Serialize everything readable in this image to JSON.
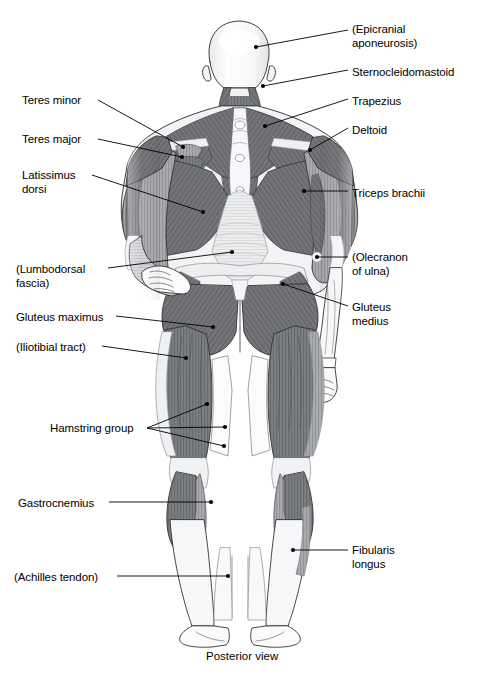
{
  "figure": {
    "caption": "Posterior view",
    "caption_pos": {
      "x": 206,
      "y": 650
    },
    "width": 479,
    "height": 677,
    "background": "#ffffff",
    "line_color": "#000000",
    "muscle_dark": "#6f7073",
    "muscle_mid": "#8e9094",
    "muscle_light": "#c8cacd",
    "tendon_light": "#f1f2f3",
    "skin": "#fdfdfd"
  },
  "labels": [
    {
      "id": "epicranial-aponeurosis",
      "text": "(Epicranial\naponeurosis)",
      "side": "right",
      "lines": [
        "(Epicranial",
        "aponeurosis)"
      ],
      "x": 352,
      "y": 22,
      "leader": [
        [
          348,
          30
        ],
        [
          256,
          47
        ]
      ],
      "dot": [
        256,
        47
      ]
    },
    {
      "id": "sternocleidomastoid",
      "text": "Sternocleidomastoid",
      "side": "right",
      "lines": [
        "Sternocleidomastoid"
      ],
      "x": 352,
      "y": 65,
      "leader": [
        [
          348,
          70
        ],
        [
          263,
          86
        ]
      ],
      "dot": [
        263,
        86
      ]
    },
    {
      "id": "trapezius",
      "text": "Trapezius",
      "side": "right",
      "lines": [
        "Trapezius"
      ],
      "x": 352,
      "y": 94,
      "leader": [
        [
          348,
          99
        ],
        [
          265,
          126
        ]
      ],
      "dot": [
        265,
        126
      ]
    },
    {
      "id": "deltoid",
      "text": "Deltoid",
      "side": "right",
      "lines": [
        "Deltoid"
      ],
      "x": 352,
      "y": 123,
      "leader": [
        [
          348,
          128
        ],
        [
          310,
          150
        ]
      ],
      "dot": [
        310,
        150
      ]
    },
    {
      "id": "triceps-brachii",
      "text": "Triceps brachii",
      "side": "right",
      "lines": [
        "Triceps brachii"
      ],
      "x": 352,
      "y": 186,
      "leader": [
        [
          348,
          191
        ],
        [
          304,
          191
        ]
      ],
      "dot": [
        304,
        191
      ]
    },
    {
      "id": "olecranon-of-ulna",
      "text": "(Olecranon\nof ulna)",
      "side": "right",
      "lines": [
        "(Olecranon",
        "of ulna)"
      ],
      "x": 352,
      "y": 250,
      "leader": [
        [
          348,
          257
        ],
        [
          317,
          257
        ]
      ],
      "dot": [
        317,
        257
      ]
    },
    {
      "id": "gluteus-medius",
      "text": "Gluteus\nmedius",
      "side": "right",
      "lines": [
        "Gluteus",
        "medius"
      ],
      "x": 352,
      "y": 300,
      "leader": [
        [
          348,
          306
        ],
        [
          283,
          284
        ]
      ],
      "dot": [
        283,
        284
      ]
    },
    {
      "id": "fibularis-longus",
      "text": "Fibularis\nlongus",
      "side": "right",
      "lines": [
        "Fibularis",
        "longus"
      ],
      "x": 352,
      "y": 543,
      "leader": [
        [
          348,
          550
        ],
        [
          293,
          550
        ]
      ],
      "dot": [
        293,
        550
      ]
    },
    {
      "id": "teres-minor",
      "text": "Teres minor",
      "side": "left",
      "lines": [
        "Teres minor"
      ],
      "x": 22,
      "y": 93,
      "leader": [
        [
          98,
          100
        ],
        [
          183,
          147
        ]
      ],
      "dot": [
        183,
        147
      ]
    },
    {
      "id": "teres-major",
      "text": "Teres major",
      "side": "left",
      "lines": [
        "Teres major"
      ],
      "x": 22,
      "y": 132,
      "leader": [
        [
          98,
          139
        ],
        [
          182,
          157
        ]
      ],
      "dot": [
        182,
        157
      ]
    },
    {
      "id": "latissimus-dorsi",
      "text": "Latissimus\ndorsi",
      "side": "left",
      "lines": [
        "Latissimus",
        "dorsi"
      ],
      "x": 22,
      "y": 168,
      "leader": [
        [
          92,
          175
        ],
        [
          203,
          212
        ]
      ],
      "dot": [
        203,
        212
      ]
    },
    {
      "id": "lumbodorsal-fascia",
      "text": "(Lumbodorsal\nfascia)",
      "side": "left",
      "lines": [
        "(Lumbodorsal",
        "fascia)"
      ],
      "x": 16,
      "y": 262,
      "leader": [
        [
          108,
          268
        ],
        [
          232,
          252
        ]
      ],
      "dot": [
        232,
        252
      ]
    },
    {
      "id": "gluteus-maximus",
      "text": "Gluteus maximus",
      "side": "left",
      "lines": [
        "Gluteus maximus"
      ],
      "x": 16,
      "y": 310,
      "leader": [
        [
          116,
          316
        ],
        [
          213,
          327
        ]
      ],
      "dot": [
        213,
        327
      ]
    },
    {
      "id": "iliotibial-tract",
      "text": "(Iliotibial tract)",
      "side": "left",
      "lines": [
        "(Iliotibial tract)"
      ],
      "x": 16,
      "y": 340,
      "leader": [
        [
          102,
          346
        ],
        [
          186,
          358
        ]
      ],
      "dot": [
        186,
        358
      ]
    },
    {
      "id": "hamstring-group",
      "text": "Hamstring group",
      "side": "left",
      "lines": [
        "Hamstring group"
      ],
      "x": 50,
      "y": 421,
      "leader": [
        [
          147,
          428
        ],
        [
          207,
          404
        ]
      ],
      "dot": [
        207,
        404
      ],
      "extra_leaders": [
        {
          "path": [
            [
              147,
              428
            ],
            [
              225,
              427
            ]
          ],
          "dot": [
            225,
            427
          ]
        },
        {
          "path": [
            [
              147,
              428
            ],
            [
              224,
              446
            ]
          ],
          "dot": [
            224,
            446
          ]
        }
      ]
    },
    {
      "id": "gastrocnemius",
      "text": "Gastrocnemius",
      "side": "left",
      "lines": [
        "Gastrocnemius"
      ],
      "x": 18,
      "y": 496,
      "leader": [
        [
          109,
          502
        ],
        [
          211,
          502
        ]
      ],
      "dot": [
        211,
        502
      ]
    },
    {
      "id": "achilles-tendon",
      "text": "(Achilles tendon)",
      "side": "left",
      "lines": [
        "(Achilles tendon)"
      ],
      "x": 14,
      "y": 570,
      "leader": [
        [
          117,
          576
        ],
        [
          228,
          576
        ]
      ],
      "dot": [
        228,
        576
      ]
    }
  ]
}
